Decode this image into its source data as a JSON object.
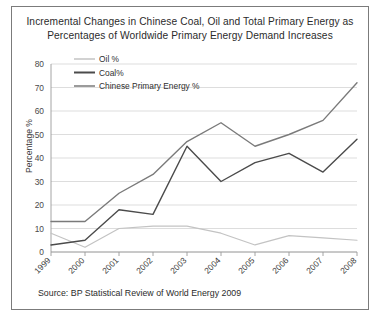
{
  "title": {
    "line1": "Incremental Changes in Chinese Coal, Oil and Total Primary Energy as",
    "line2": "Percentages of Worldwide Primary Energy Demand Increases"
  },
  "source": "Source: BP Statistical Review of World Energy 2009",
  "axis": {
    "ylabel": "Percentage %",
    "yticks": [
      "0",
      "10",
      "20",
      "30",
      "40",
      "50",
      "60",
      "70",
      "80"
    ],
    "xticks": [
      "1999",
      "2000",
      "2001",
      "2002",
      "2003",
      "2004",
      "2005",
      "2006",
      "2007",
      "2008"
    ]
  },
  "legend": {
    "items": [
      {
        "label": "Oil %",
        "color": "#c3c3c3"
      },
      {
        "label": "Coal%",
        "color": "#4b4b4b"
      },
      {
        "label": "Chinese Primary Energy %",
        "color": "#7a7a7a"
      }
    ]
  },
  "colors": {
    "frame_border": "#7b7b7b",
    "gridline": "#d4d4d4",
    "axis": "#9a9a9a",
    "background": "#ffffff",
    "text": "#2b2b2b"
  },
  "chart_data": {
    "type": "line",
    "title": "Incremental Changes in Chinese Coal, Oil and Total Primary Energy as Percentages of Worldwide Primary Energy Demand Increases",
    "xlabel": "",
    "ylabel": "Percentage %",
    "ylim": [
      0,
      80
    ],
    "ytick_step": 10,
    "grid": true,
    "legend_position": "top-left-inside",
    "categories": [
      "1999",
      "2000",
      "2001",
      "2002",
      "2003",
      "2004",
      "2005",
      "2006",
      "2007",
      "2008"
    ],
    "series": [
      {
        "name": "Oil %",
        "color": "#c3c3c3",
        "values": [
          8,
          2,
          10,
          11,
          11,
          8,
          3,
          7,
          6,
          5
        ]
      },
      {
        "name": "Coal%",
        "color": "#4b4b4b",
        "values": [
          3,
          5,
          18,
          16,
          45,
          30,
          38,
          42,
          34,
          48
        ]
      },
      {
        "name": "Chinese Primary Energy %",
        "color": "#7a7a7a",
        "values": [
          13,
          13,
          25,
          33,
          47,
          55,
          45,
          50,
          56,
          72
        ]
      }
    ],
    "annotations": [
      "Source: BP Statistical Review of World Energy 2009"
    ]
  }
}
